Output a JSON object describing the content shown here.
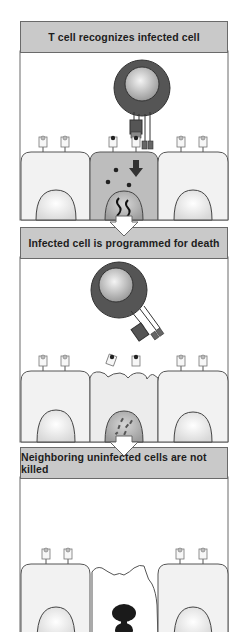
{
  "panels": [
    {
      "title": "T cell recognizes infected cell",
      "state": "recognition",
      "infected_cell_color": "#bdbdbd"
    },
    {
      "title": "Infected cell is programmed for death",
      "state": "programmed-death",
      "infected_cell_color": "#ececec"
    },
    {
      "title": "Neighboring uninfected cells are not killed",
      "state": "apoptosis",
      "infected_cell_color": "#ffffff"
    }
  ],
  "colors": {
    "header_bg": "#c9c9c9",
    "border": "#6a6a6a",
    "t_cell_outer": "#555555",
    "t_cell_nucleus": "#bcbcbc",
    "healthy_cell": "#f2f2f2",
    "infected_cell": "#bdbdbd",
    "apoptotic_nucleus": "#1a1a1a"
  }
}
